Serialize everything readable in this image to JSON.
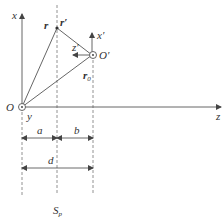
{
  "diagram": {
    "labels": {
      "x_axis": "x",
      "z_axis": "z",
      "y_axis": "y",
      "origin": "O",
      "origin_prime": "O′",
      "x_prime": "x′",
      "z_prime": "z′",
      "r": "r",
      "r_prime": "r′",
      "r0": "r",
      "r0_sub": "0",
      "a": "a",
      "b": "b",
      "d": "d",
      "plane": "S",
      "plane_sub": "p"
    },
    "colors": {
      "line": "#555555",
      "text": "#333333"
    }
  }
}
